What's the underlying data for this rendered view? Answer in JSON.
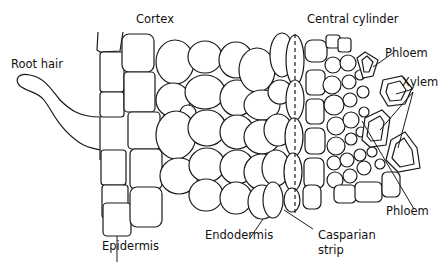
{
  "diagram": {
    "labels": {
      "cortex": "Cortex",
      "central_cylinder": "Central cylinder",
      "root_hair": "Root hair",
      "phloem_top": "Phloem",
      "xylem": "Xylem",
      "phloem_bottom": "Phloem",
      "epidermis": "Epidermis",
      "endodermis": "Endodermis",
      "casparian_line1": "Casparian",
      "casparian_line2": "strip"
    },
    "colors": {
      "line": "#1a1a1a",
      "background": "#ffffff"
    }
  }
}
